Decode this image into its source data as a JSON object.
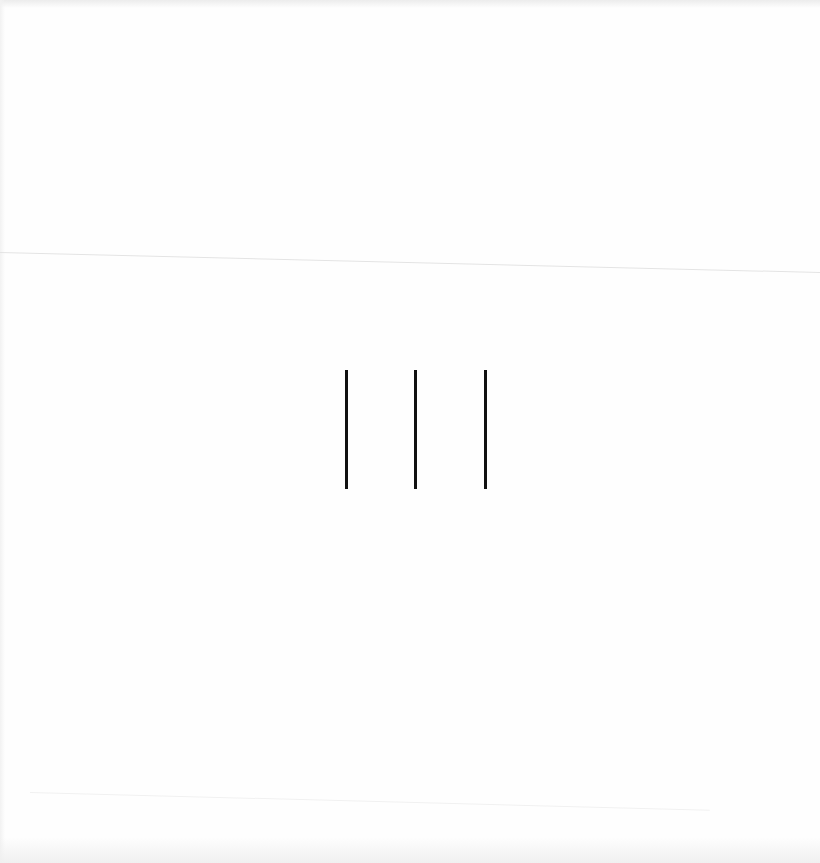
{
  "scene": {
    "description": "Sheet of paper with three vertical strokes",
    "paper_color": "#fefefe",
    "fold_line_color": "#e4e4e4",
    "stroke_color": "#111111",
    "strokes": [
      {
        "id": 1
      },
      {
        "id": 2
      },
      {
        "id": 3
      }
    ],
    "stroke_count": 3
  }
}
